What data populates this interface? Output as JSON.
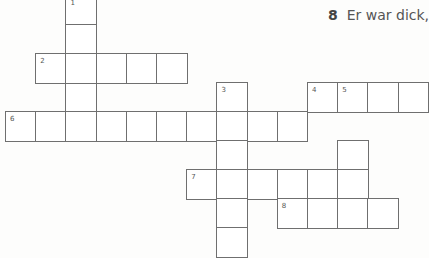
{
  "clue": {
    "number": "8",
    "text": "Er war dick,"
  },
  "grid": {
    "origin_x": 5,
    "origin_y": -5,
    "cell_w": 30.2,
    "cell_h": 29,
    "cells": [
      {
        "c": 2,
        "r": 0,
        "n": "1"
      },
      {
        "c": 2,
        "r": 1
      },
      {
        "c": 2,
        "r": 3
      },
      {
        "c": 1,
        "r": 2,
        "n": "2"
      },
      {
        "c": 2,
        "r": 2
      },
      {
        "c": 3,
        "r": 2
      },
      {
        "c": 4,
        "r": 2
      },
      {
        "c": 5,
        "r": 2
      },
      {
        "c": 7,
        "r": 3,
        "n": "3"
      },
      {
        "c": 10,
        "r": 3,
        "n": "4"
      },
      {
        "c": 11,
        "r": 3,
        "n": "5"
      },
      {
        "c": 12,
        "r": 3
      },
      {
        "c": 13,
        "r": 3
      },
      {
        "c": 0,
        "r": 4,
        "n": "6"
      },
      {
        "c": 1,
        "r": 4
      },
      {
        "c": 2,
        "r": 4
      },
      {
        "c": 3,
        "r": 4
      },
      {
        "c": 4,
        "r": 4
      },
      {
        "c": 5,
        "r": 4
      },
      {
        "c": 6,
        "r": 4
      },
      {
        "c": 7,
        "r": 4
      },
      {
        "c": 8,
        "r": 4
      },
      {
        "c": 9,
        "r": 4
      },
      {
        "c": 7,
        "r": 5
      },
      {
        "c": 11,
        "r": 5
      },
      {
        "c": 6,
        "r": 6,
        "n": "7"
      },
      {
        "c": 7,
        "r": 6
      },
      {
        "c": 8,
        "r": 6
      },
      {
        "c": 9,
        "r": 6
      },
      {
        "c": 10,
        "r": 6
      },
      {
        "c": 11,
        "r": 6
      },
      {
        "c": 7,
        "r": 7
      },
      {
        "c": 9,
        "r": 7,
        "n": "8"
      },
      {
        "c": 10,
        "r": 7
      },
      {
        "c": 11,
        "r": 7
      },
      {
        "c": 12,
        "r": 7
      },
      {
        "c": 7,
        "r": 8
      }
    ]
  }
}
